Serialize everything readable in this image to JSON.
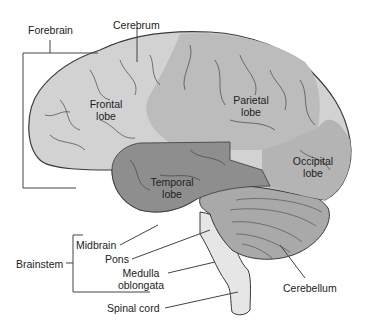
{
  "diagram": {
    "labels": {
      "forebrain": "Forebrain",
      "cerebrum": "Cerebrum",
      "frontal_1": "Frontal",
      "frontal_2": "lobe",
      "parietal_1": "Parietal",
      "parietal_2": "lobe",
      "temporal_1": "Temporal",
      "temporal_2": "lobe",
      "occipital_1": "Occipital",
      "occipital_2": "lobe",
      "midbrain": "Midbrain",
      "pons": "Pons",
      "medulla_1": "Medulla",
      "medulla_2": "oblongata",
      "brainstem": "Brainstem",
      "spinal_cord": "Spinal cord",
      "cerebellum": "Cerebellum"
    },
    "colors": {
      "frontal": "#d2d2d2",
      "parietal": "#bcbcbc",
      "occipital": "#b4b4b4",
      "temporal": "#8e8e8e",
      "cerebellum": "#a9a9a9",
      "brainstem": "#e6e6e6",
      "outline": "#3a3a3a"
    }
  }
}
